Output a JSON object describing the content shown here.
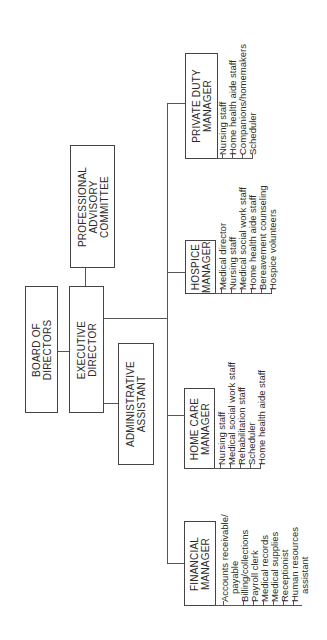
{
  "chart": {
    "orientation": "rotated-90-ccw",
    "nodes": {
      "board": {
        "label": "BOARD OF\nDIRECTORS"
      },
      "executive": {
        "label": "EXECUTIVE\nDIRECTOR"
      },
      "advisory": {
        "label": "PROFESSIONAL\nADVISORY\nCOMMITTEE"
      },
      "admin": {
        "label": "ADMINISTRATIVE\nASSISTANT"
      },
      "financial": {
        "label": "FINANCIAL\nMANAGER",
        "items": [
          "Accounts receivable/",
          "   payable",
          "Billing/collections",
          "Payroll clerk",
          "Medical records",
          "Medical supplies",
          "Receptionist",
          "Human resources",
          "   assistant"
        ]
      },
      "homecare": {
        "label": "HOME CARE\nMANAGER",
        "items": [
          "Nursing staff",
          "Medical social work staff",
          "Rehabilitation staff",
          "Scheduler",
          "Home health aide staff"
        ]
      },
      "hospice": {
        "label": "HOSPICE\nMANAGER",
        "items": [
          "Medical director",
          "Nursing staff",
          "Medical social work staff",
          "Home health aide staff",
          "Bereavement counseling",
          "Hospice volunteers"
        ]
      },
      "privateduty": {
        "label": "PRIVATE DUTY\nMANAGER",
        "items": [
          "Nursing staff",
          "Home health aide staff",
          "Companions/homemakers",
          "Scheduler"
        ]
      }
    }
  }
}
